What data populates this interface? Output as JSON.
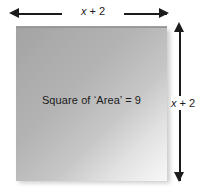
{
  "figure": {
    "type": "geometry-diagram",
    "shape": "square",
    "interior_label": "Square of ‘Area’ = 9",
    "width_label": "x + 2",
    "height_label": "x + 2",
    "colors": {
      "fill_dark": "#a3a3a3",
      "fill_light": "#f8f8f8",
      "line": "#1b1b1b",
      "background": "#ffffff"
    },
    "arrows": {
      "horizontal": "double-headed-horizontal-arrow",
      "vertical": "double-headed-vertical-arrow"
    }
  }
}
